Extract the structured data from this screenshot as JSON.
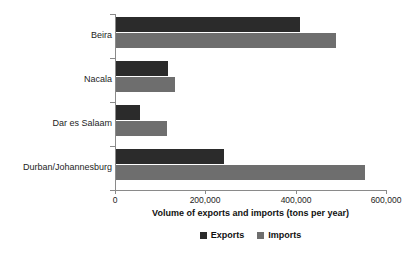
{
  "chart_data": {
    "type": "bar",
    "orientation": "horizontal",
    "title": "",
    "xlabel": "Volume of exports and imports (tons per year)",
    "ylabel": "",
    "categories": [
      "Beira",
      "Nacala",
      "Dar es Salaam",
      "Durban/Johannesburg"
    ],
    "series": [
      {
        "name": "Exports",
        "color": "#2b2b2b",
        "values": [
          410000,
          117000,
          55000,
          241000
        ]
      },
      {
        "name": "Imports",
        "color": "#6e6e6e",
        "values": [
          490000,
          133000,
          115000,
          553000
        ]
      }
    ],
    "xlim": [
      0,
      600000
    ],
    "xticks": [
      0,
      200000,
      400000,
      600000
    ],
    "xtick_labels": [
      "0",
      "200,000",
      "400,000",
      "600,000"
    ],
    "grid": false,
    "legend_position": "bottom-center"
  },
  "axis": {
    "x_title": "Volume of exports and imports (tons per year)",
    "ticks": [
      {
        "label": "0",
        "value": 0
      },
      {
        "label": "200,000",
        "value": 200000
      },
      {
        "label": "400,000",
        "value": 400000
      },
      {
        "label": "600,000",
        "value": 600000
      }
    ]
  },
  "categories": [
    {
      "label": "Beira"
    },
    {
      "label": "Nacala"
    },
    {
      "label": "Dar es Salaam"
    },
    {
      "label": "Durban/Johannesburg"
    }
  ],
  "legend": {
    "entries": [
      {
        "label": "Exports",
        "color": "#2b2b2b"
      },
      {
        "label": "Imports",
        "color": "#6e6e6e"
      }
    ]
  }
}
